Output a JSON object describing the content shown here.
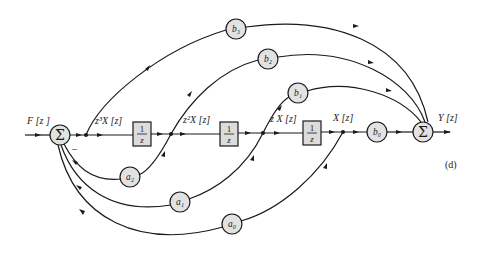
{
  "figure": {
    "panel_label": "(d)",
    "input_label": "F [z ]",
    "output_label": "Y [z]",
    "summer_symbol": "Σ",
    "sign_minus": "–",
    "signal_labels": {
      "z3x": "z³X [z]",
      "z2x": "z²X [z]",
      "zx": "z X [z]",
      "x": "X [z]"
    },
    "delay_blocks": [
      {
        "numerator": "1",
        "denominator": "z"
      },
      {
        "numerator": "1",
        "denominator": "z"
      },
      {
        "numerator": "1",
        "denominator": "z"
      }
    ],
    "feedforward_gains": [
      "b3",
      "b2",
      "b1",
      "b0"
    ],
    "feedback_gains": [
      "a2",
      "a1",
      "a0"
    ],
    "gain_labels": {
      "b3": "b₃",
      "b2": "b₂",
      "b1": "b₁",
      "b0": "b₀",
      "a2": "a₂",
      "a1": "a₁",
      "a0": "a₀"
    }
  }
}
